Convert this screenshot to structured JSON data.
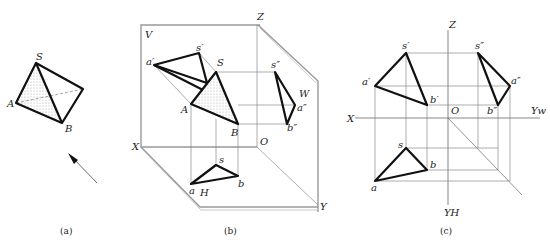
{
  "figure_a": {
    "caption": "(a)",
    "labels": {
      "S": "S",
      "A": "A",
      "B": "B"
    }
  },
  "figure_b": {
    "caption": "(b)",
    "planes": {
      "V": "V",
      "H": "H",
      "W": "W"
    },
    "axes": {
      "X": "X",
      "Y": "Y",
      "Z": "Z",
      "O": "O"
    },
    "space_points": {
      "S": "S",
      "A": "A",
      "B": "B"
    },
    "v_proj": {
      "s": "s′",
      "a": "a′"
    },
    "w_proj": {
      "s": "s″",
      "a": "a″",
      "b": "b″"
    },
    "h_proj": {
      "s": "s",
      "a": "a",
      "b": "b"
    }
  },
  "figure_c": {
    "caption": "(c)",
    "axes": {
      "X": "X",
      "Z": "Z",
      "O": "O",
      "Yw": "Yw",
      "Yh": "YH"
    },
    "v_proj": {
      "s": "s′",
      "a": "a′",
      "b": "b′"
    },
    "w_proj": {
      "s": "s″",
      "a": "a″",
      "b": "b″"
    },
    "h_proj": {
      "s": "s",
      "a": "a",
      "b": "b"
    }
  }
}
